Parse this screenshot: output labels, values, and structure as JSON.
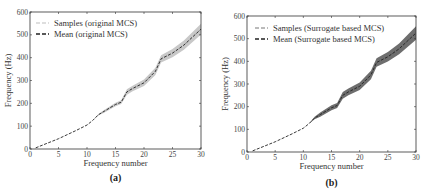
{
  "chart_data": [
    {
      "type": "line",
      "panel": "(a)",
      "xlabel": "Frequency number",
      "ylabel": "Frequency (Hz)",
      "xlim": [
        0,
        30
      ],
      "ylim": [
        0,
        600
      ],
      "xticks": [
        0,
        5,
        10,
        15,
        20,
        25,
        30
      ],
      "yticks": [
        0,
        100,
        200,
        300,
        400,
        500,
        600
      ],
      "grid": false,
      "legend_position": "upper left",
      "series": [
        {
          "name": "Samples (original MCS)",
          "style": "light gray dashed band"
        },
        {
          "name": "Mean (original MCS)",
          "style": "black dashed",
          "x": [
            1,
            3,
            5,
            8,
            10,
            11,
            12,
            13,
            15,
            16,
            17,
            18,
            20,
            22,
            23,
            25,
            27,
            30
          ],
          "y": [
            5,
            25,
            45,
            80,
            105,
            125,
            150,
            165,
            195,
            205,
            250,
            265,
            290,
            340,
            395,
            420,
            455,
            525
          ]
        }
      ],
      "band_halfwidth": [
        0,
        0,
        0,
        0,
        0,
        0,
        3,
        6,
        8,
        8,
        12,
        12,
        14,
        16,
        16,
        18,
        20,
        24
      ]
    },
    {
      "type": "line",
      "panel": "(b)",
      "xlabel": "Frequency number",
      "ylabel": "Frequency (Hz)",
      "xlim": [
        0,
        30
      ],
      "ylim": [
        0,
        600
      ],
      "xticks": [
        0,
        5,
        10,
        15,
        20,
        25,
        30
      ],
      "yticks": [
        0,
        100,
        200,
        300,
        400,
        500,
        600
      ],
      "grid": false,
      "legend_position": "upper left",
      "series": [
        {
          "name": "Samples (Surrogate based MCS)",
          "style": "dark gray dashed band"
        },
        {
          "name": "Mean (Surrogate based MCS)",
          "style": "black dashed",
          "x": [
            1,
            3,
            5,
            8,
            10,
            11,
            12,
            13,
            15,
            16,
            17,
            18,
            20,
            22,
            23,
            25,
            27,
            30
          ],
          "y": [
            5,
            25,
            45,
            80,
            105,
            125,
            150,
            165,
            195,
            205,
            250,
            265,
            290,
            340,
            395,
            420,
            455,
            525
          ]
        }
      ],
      "band_halfwidth": [
        0,
        0,
        0,
        0,
        0,
        0,
        6,
        9,
        11,
        11,
        15,
        15,
        17,
        19,
        19,
        21,
        24,
        30
      ]
    }
  ],
  "panels": [
    {
      "caption": "(a)",
      "xlabel": "Frequency number",
      "ylabel": "Frequency (Hz)",
      "legend": [
        "Samples (original MCS)",
        "Mean (original MCS)"
      ]
    },
    {
      "caption": "(b)",
      "xlabel": "Frequency number",
      "ylabel": "Frequency (Hz)",
      "legend": [
        "Samples (Surrogate based MCS)",
        "Mean (Surrogate based MCS)"
      ]
    }
  ],
  "colors": {
    "band_a": "#c8c8c8",
    "band_b": "#6e6e6e",
    "mean": "#222222",
    "sample_a": "#bdbdbd",
    "sample_b": "#777777"
  }
}
